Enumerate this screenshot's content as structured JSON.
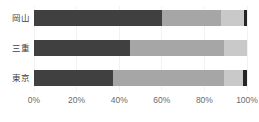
{
  "chart_data": {
    "type": "bar",
    "orientation": "horizontal",
    "stacked": true,
    "normalized_percent": true,
    "title": "",
    "subtitle": "",
    "xlabel": "",
    "ylabel": "",
    "xlim": [
      0,
      100
    ],
    "grid": true,
    "legend": "none",
    "categories": [
      "岡山",
      "三重",
      "東京"
    ],
    "tick_labels": [
      "0%",
      "20%",
      "40%",
      "60%",
      "80%",
      "100%"
    ],
    "tick_values": [
      0,
      20,
      40,
      60,
      80,
      100
    ],
    "series": [
      {
        "name": "series-1",
        "color": "#404040",
        "values": [
          60,
          45,
          37
        ]
      },
      {
        "name": "series-2",
        "color": "#a6a6a6",
        "values": [
          28,
          44,
          52
        ]
      },
      {
        "name": "series-3",
        "color": "#c9c9c9",
        "values": [
          10.5,
          11,
          9
        ]
      },
      {
        "name": "series-4",
        "color": "#262626",
        "values": [
          1.5,
          0,
          2
        ]
      }
    ],
    "rows": [
      {
        "label": "岡山",
        "segments": [
          {
            "series": "series-1",
            "value": 60,
            "color": "#404040"
          },
          {
            "series": "series-2",
            "value": 28,
            "color": "#a6a6a6"
          },
          {
            "series": "series-3",
            "value": 10.5,
            "color": "#c9c9c9"
          },
          {
            "series": "series-4",
            "value": 1.5,
            "color": "#262626"
          }
        ]
      },
      {
        "label": "三重",
        "segments": [
          {
            "series": "series-1",
            "value": 45,
            "color": "#404040"
          },
          {
            "series": "series-2",
            "value": 44,
            "color": "#a6a6a6"
          },
          {
            "series": "series-3",
            "value": 11,
            "color": "#c9c9c9"
          },
          {
            "series": "series-4",
            "value": 0,
            "color": "#262626"
          }
        ]
      },
      {
        "label": "東京",
        "segments": [
          {
            "series": "series-1",
            "value": 37,
            "color": "#404040"
          },
          {
            "series": "series-2",
            "value": 52,
            "color": "#a6a6a6"
          },
          {
            "series": "series-3",
            "value": 9,
            "color": "#c9c9c9"
          },
          {
            "series": "series-4",
            "value": 2,
            "color": "#262626"
          }
        ]
      }
    ],
    "colors": {
      "series_1": "#404040",
      "series_2": "#a6a6a6",
      "series_3": "#c9c9c9",
      "series_4": "#262626",
      "gridline": "#f2f2f2",
      "tick_text": "#6b6b6b",
      "category_text": "#3f3f3f",
      "background": "#ffffff"
    }
  }
}
